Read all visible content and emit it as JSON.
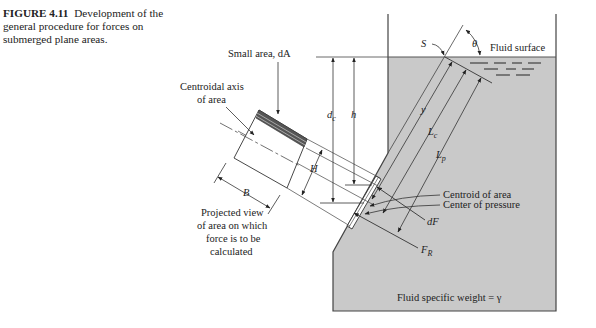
{
  "caption": {
    "figure_number": "FIGURE 4.11",
    "text": "Development of the general procedure for forces on submerged plane areas."
  },
  "labels": {
    "small_area": "Small area, dA",
    "centroidal_axis_line1": "Centroidal axis",
    "centroidal_axis_line2": "of area",
    "projected_view_line1": "Projected view",
    "projected_view_line2": "of area on which",
    "projected_view_line3": "force is to be",
    "projected_view_line4": "calculated",
    "fluid_surface": "Fluid surface",
    "centroid_of_area": "Centroid of area",
    "center_of_pressure": "Center of pressure",
    "fluid_specific_weight": "Fluid specific weight = γ"
  },
  "symbols": {
    "S": "S",
    "theta": "θ",
    "y": "y",
    "Lc": "L",
    "Lc_sub": "c",
    "Lp": "L",
    "Lp_sub": "p",
    "dc": "d",
    "dc_sub": "c",
    "h": "h",
    "H": "H",
    "B": "B",
    "dF": "dF",
    "FR": "F",
    "FR_sub": "R"
  },
  "colors": {
    "fluid": "#c8c8c8",
    "line": "#333333",
    "dark_band": "#555555"
  }
}
